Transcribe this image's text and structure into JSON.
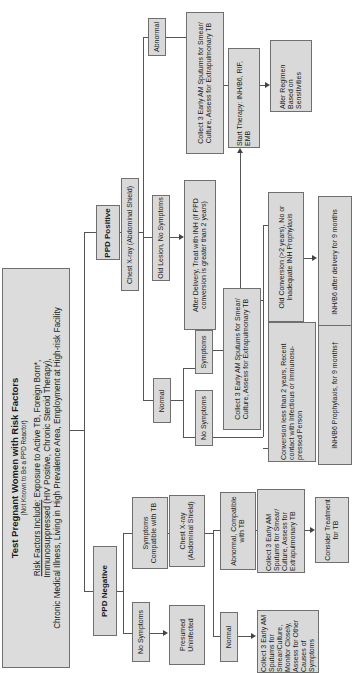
{
  "diagram": {
    "title": "Test Pregnant Women with Risk Factors",
    "subtitle": "(Not Known to Be a PPD Reactor)",
    "risk_label": "Risk Factors Include:",
    "risk_line1": " Exposure to Active TB, Foreign Born*,",
    "risk_line2": "Immunosuppressed (HIV Positive, Chronic Steroid Therapy),",
    "risk_line3": "Chronic Medical Illness, Living in High Prevalence Area, Employment at High-risk Facility",
    "positive": {
      "label": "PPD Positive",
      "chest_xray": "Chest X-ray (Abdominal Shield)",
      "abnormal": "Abnormal",
      "abnormal_action": "Collect 3 Early AM Sputums for Smear/ Culture, Assess for Extrapulmonary TB",
      "start_therapy": "Start Therapy: INH/B6, RIF, EMB",
      "alter_regimen": "Alter Regimen Based on Sensitivities",
      "old_lesion": "Old Lesion, No Symptoms",
      "after_delivery": "After Delivery, Treat with INH (if PPD conversion is greater than 2 years)",
      "normal": "Normal",
      "symptoms": "Symptoms",
      "no_symptoms": "No Symptoms",
      "symptoms_action": "Collect 3 Early AM Sputums for Smear/ Culture, Assess for Extrapulmonary TB",
      "old_conversion": "Old Conversion (>2 years), No or Inadequate INH Prophylaxis",
      "old_conversion_action": "INH/B6 after delivery for 9 months",
      "recent_conversion": "Conversion less than 2 years, Recent contact with Infectious or Immunosu- pressed Person",
      "recent_conversion_action": "INH/B6 Prophylaxis, for 9 months†"
    },
    "negative": {
      "label": "PPD Negative",
      "symptoms_compatible": "Symptoms Compatible with TB",
      "chest_xray": "Chest X-ray (Abdominal Shield)",
      "abnormal_compatible": "Abnormal, Compatible with TB",
      "abnormal_action": "Collect 3 Early AM Sputums for Smear/ Culture, Assess for Extrapulmonary TB",
      "consider_treatment": "Consider Treatment for TB",
      "normal": "Normal",
      "normal_action": "Collect 3 Early AM Sputums for Smear/Culture, Monitor Closely, Assess for Other Causes of Symptoms",
      "no_symptoms": "No Symptoms",
      "presumed": "Presumed Uninfected"
    }
  },
  "colors": {
    "box_fill": "#d9d9d9",
    "border": "#6f6f6f",
    "line": "#555555"
  }
}
